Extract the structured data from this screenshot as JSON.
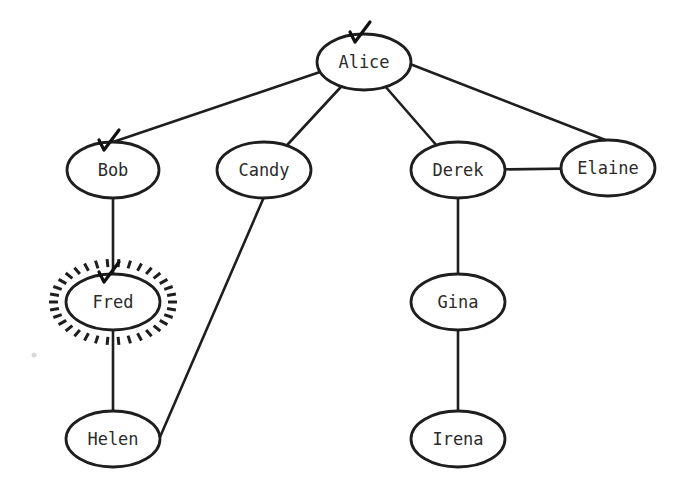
{
  "diagram": {
    "type": "tree-graph",
    "nodes": [
      {
        "id": "alice",
        "label": "Alice",
        "x": 364,
        "y": 62,
        "rx": 47,
        "ry": 28,
        "checked": true,
        "highlighted": false
      },
      {
        "id": "bob",
        "label": "Bob",
        "x": 113,
        "y": 170,
        "rx": 46,
        "ry": 28,
        "checked": true,
        "highlighted": false
      },
      {
        "id": "candy",
        "label": "Candy",
        "x": 264,
        "y": 170,
        "rx": 47,
        "ry": 28,
        "checked": false,
        "highlighted": false
      },
      {
        "id": "derek",
        "label": "Derek",
        "x": 458,
        "y": 170,
        "rx": 47,
        "ry": 28,
        "checked": false,
        "highlighted": false
      },
      {
        "id": "elaine",
        "label": "Elaine",
        "x": 608,
        "y": 168,
        "rx": 47,
        "ry": 28,
        "checked": false,
        "highlighted": false
      },
      {
        "id": "fred",
        "label": "Fred",
        "x": 113,
        "y": 302,
        "rx": 47,
        "ry": 28,
        "checked": true,
        "highlighted": true
      },
      {
        "id": "gina",
        "label": "Gina",
        "x": 458,
        "y": 302,
        "rx": 47,
        "ry": 28,
        "checked": false,
        "highlighted": false
      },
      {
        "id": "helen",
        "label": "Helen",
        "x": 113,
        "y": 439,
        "rx": 47,
        "ry": 28,
        "checked": false,
        "highlighted": false
      },
      {
        "id": "irena",
        "label": "Irena",
        "x": 458,
        "y": 439,
        "rx": 47,
        "ry": 28,
        "checked": false,
        "highlighted": false
      }
    ],
    "edges": [
      {
        "from": "alice",
        "to": "bob"
      },
      {
        "from": "alice",
        "to": "candy"
      },
      {
        "from": "alice",
        "to": "derek"
      },
      {
        "from": "alice",
        "to": "elaine"
      },
      {
        "from": "derek",
        "to": "elaine"
      },
      {
        "from": "bob",
        "to": "fred"
      },
      {
        "from": "fred",
        "to": "helen"
      },
      {
        "from": "candy",
        "to": "helen"
      },
      {
        "from": "derek",
        "to": "gina"
      },
      {
        "from": "gina",
        "to": "irena"
      }
    ],
    "colors": {
      "stroke": "#1e1e1e",
      "text": "#2b2b2b",
      "background": "#ffffff"
    }
  }
}
